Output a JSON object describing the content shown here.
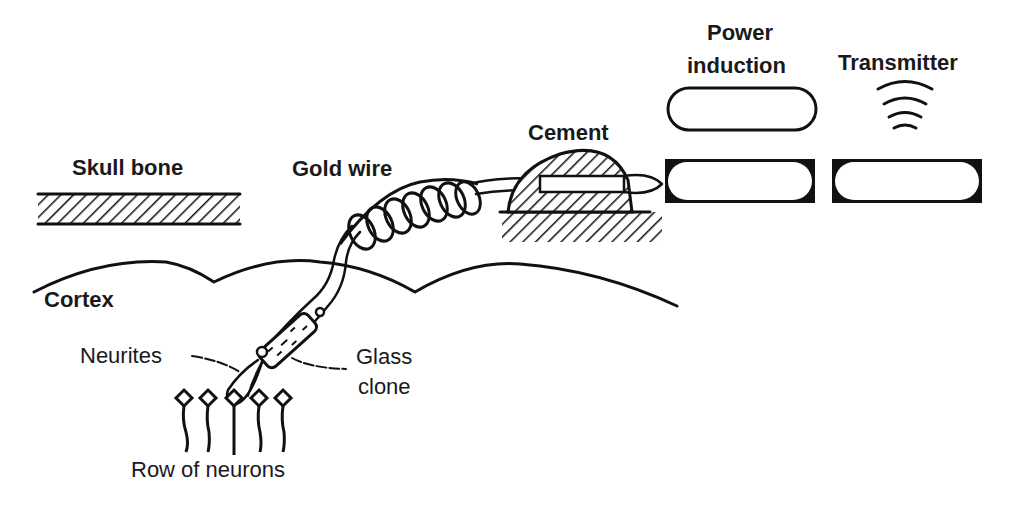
{
  "diagram": {
    "colors": {
      "ink": "#111111",
      "background": "#ffffff"
    },
    "labels": {
      "skull_bone": "Skull bone",
      "gold_wire": "Gold wire",
      "cement": "Cement",
      "power_induction_line1": "Power",
      "power_induction_line2": "induction",
      "transmitter": "Transmitter",
      "cortex": "Cortex",
      "neurites": "Neurites",
      "glass_clone_line1": "Glass",
      "glass_clone_line2": "clone",
      "row_of_neurons": "Row of neurons"
    },
    "components": [
      {
        "name": "skull-bone",
        "kind": "hatched-slab"
      },
      {
        "name": "gold-wire",
        "kind": "coiled-wire"
      },
      {
        "name": "cement",
        "kind": "hatched-mound"
      },
      {
        "name": "power-induction-external-coil",
        "kind": "rounded-rect"
      },
      {
        "name": "power-induction-implant",
        "kind": "box"
      },
      {
        "name": "transmitter-implant",
        "kind": "box"
      },
      {
        "name": "transmitter-signal",
        "kind": "radio-waves"
      },
      {
        "name": "cortex-surface",
        "kind": "wavy-line"
      },
      {
        "name": "glass-electrode",
        "kind": "cylinder"
      },
      {
        "name": "neurons",
        "kind": "row",
        "count": 5
      }
    ]
  }
}
